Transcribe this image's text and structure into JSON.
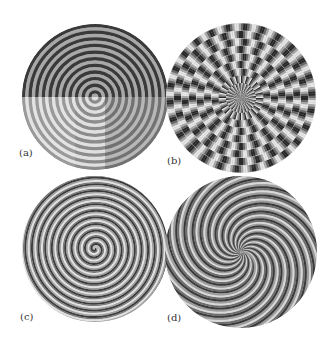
{
  "figure": {
    "panels": [
      {
        "id": "a",
        "label": "(a)",
        "type": "concentric-rings-split",
        "cx": 95,
        "cy": 97,
        "r": 73,
        "rings": 11,
        "label_pos": {
          "x": 19,
          "y": 147
        }
      },
      {
        "id": "b",
        "label": "(b)",
        "type": "segmented-rings-radial",
        "cx": 241,
        "cy": 98,
        "r": 75,
        "rings": 10,
        "spokes": 24,
        "label_pos": {
          "x": 167,
          "y": 155
        }
      },
      {
        "id": "c",
        "label": "(c)",
        "type": "single-spiral",
        "cx": 95,
        "cy": 249,
        "r": 73,
        "turns": 11,
        "label_pos": {
          "x": 20,
          "y": 311
        }
      },
      {
        "id": "d",
        "label": "(d)",
        "type": "multi-arm-spiral",
        "cx": 241,
        "cy": 252,
        "r": 76,
        "arms": 16,
        "label_pos": {
          "x": 167,
          "y": 312
        }
      }
    ],
    "colors": {
      "dark": "#3a3a3a",
      "mid": "#8a8a8a",
      "light": "#d8d8d8",
      "background": "#ffffff"
    }
  }
}
